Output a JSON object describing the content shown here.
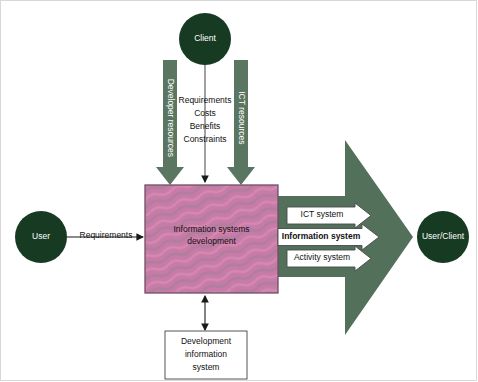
{
  "diagram": {
    "type": "flow-diagram",
    "colors": {
      "circle_fill": "#173a22",
      "arrow_green": "#5a7560",
      "big_arrow_green": "#53705b",
      "box_pink_base": "#c87ba8",
      "box_pink_wave": "#ad7f9c",
      "box_border": "#6f4f63",
      "white_arrow": "#ffffff",
      "outline": "#555555",
      "frame": "#d8d8d8"
    },
    "nodes": {
      "client": {
        "label": "Client",
        "shape": "circle"
      },
      "user": {
        "label": "User",
        "shape": "circle"
      },
      "user_client": {
        "label": "User/Client",
        "shape": "circle"
      },
      "isd_box": {
        "line1": "Information systems",
        "line2": "development",
        "shape": "rectangle"
      },
      "dev_info_box": {
        "line1": "Development",
        "line2": "information",
        "line3": "system",
        "shape": "rectangle"
      }
    },
    "inbound_arrows": {
      "developer_resources": {
        "label": "Developer resources",
        "orientation": "vertical",
        "direction": "down"
      },
      "ict_resources": {
        "label": "ICT resources",
        "orientation": "vertical",
        "direction": "down"
      },
      "client_inputs": {
        "items": [
          "Requirements",
          "Costs",
          "Benefits",
          "Constraints"
        ],
        "direction": "down"
      },
      "user_requirements": {
        "label": "Requirements",
        "direction": "right"
      }
    },
    "outbound_arrows": [
      {
        "label": "ICT system",
        "bold": false
      },
      {
        "label": "Information system",
        "bold": true
      },
      {
        "label": "Activity system",
        "bold": false
      }
    ],
    "bidirectional_link": {
      "from": "isd_box",
      "to": "dev_info_box",
      "direction": "both"
    }
  }
}
